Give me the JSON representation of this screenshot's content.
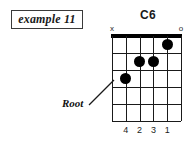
{
  "example": {
    "label": "example 11"
  },
  "chord": {
    "name": "C6",
    "strings": 6,
    "frets": 5,
    "string_markers": [
      {
        "string": 1,
        "symbol": "x",
        "meaning": "muted"
      },
      {
        "string": 6,
        "symbol": "o",
        "meaning": "open"
      }
    ],
    "dots": [
      {
        "string": 5,
        "fret": 1,
        "finger": "1"
      },
      {
        "string": 3,
        "fret": 2,
        "finger": "2"
      },
      {
        "string": 4,
        "fret": 2,
        "finger": "3"
      },
      {
        "string": 2,
        "fret": 3,
        "finger": "4",
        "root": true
      }
    ],
    "finger_numbers": [
      {
        "string": 2,
        "label": "4"
      },
      {
        "string": 3,
        "label": "2"
      },
      {
        "string": 4,
        "label": "3"
      },
      {
        "string": 5,
        "label": "1"
      }
    ]
  },
  "annotations": {
    "root_label": "Root"
  },
  "colors": {
    "ink": "#1a1a1a",
    "dot": "#000000",
    "background": "#ffffff",
    "box_border": "#3a3a3a"
  }
}
